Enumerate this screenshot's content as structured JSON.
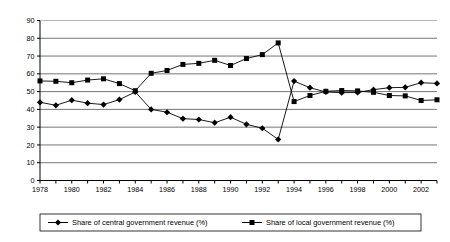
{
  "chart_data": {
    "type": "line",
    "title": "",
    "xlabel": "",
    "ylabel": "",
    "ylim": [
      0,
      90
    ],
    "ytick_step": 10,
    "yticks": [
      "0",
      "10",
      "20",
      "30",
      "40",
      "50",
      "60",
      "70",
      "80",
      "90"
    ],
    "xlim": [
      1978,
      2003
    ],
    "xtick_step": 1,
    "xtick_labels_shown": [
      "1978",
      "1980",
      "1982",
      "1984",
      "1986",
      "1988",
      "1990",
      "1992",
      "1994",
      "1996",
      "1998",
      "2000",
      "2002"
    ],
    "x": [
      1978,
      1979,
      1980,
      1981,
      1982,
      1983,
      1984,
      1985,
      1986,
      1987,
      1988,
      1989,
      1990,
      1991,
      1992,
      1993,
      1994,
      1995,
      1996,
      1997,
      1998,
      1999,
      2000,
      2001,
      2002,
      2003
    ],
    "grid": "horizontal",
    "legend_position": "bottom",
    "series": [
      {
        "name": "Share of central government revenue (%)",
        "marker": "diamond",
        "color": "#000000",
        "values": [
          44.0,
          42.3,
          45.2,
          43.5,
          42.7,
          45.5,
          49.8,
          40.0,
          38.4,
          34.8,
          34.3,
          32.5,
          35.6,
          31.6,
          29.4,
          23.1,
          55.9,
          52.2,
          49.8,
          49.4,
          49.5,
          51.1,
          52.2,
          52.4,
          55.0,
          54.6
        ]
      },
      {
        "name": "Share of local government revenue (%)",
        "marker": "square",
        "color": "#000000",
        "values": [
          56.0,
          55.8,
          55.0,
          56.5,
          57.2,
          54.5,
          50.5,
          60.3,
          61.9,
          65.3,
          65.9,
          67.6,
          64.7,
          68.6,
          70.8,
          77.4,
          44.4,
          47.8,
          50.2,
          50.6,
          50.4,
          49.6,
          47.8,
          47.6,
          45.0,
          45.4
        ]
      }
    ]
  },
  "legend": {
    "entries": [
      {
        "label": "Share of central government revenue (%)",
        "marker": "diamond"
      },
      {
        "label": "Share of local government revenue (%)",
        "marker": "square"
      }
    ]
  },
  "top_artifact": {
    "text": ""
  }
}
